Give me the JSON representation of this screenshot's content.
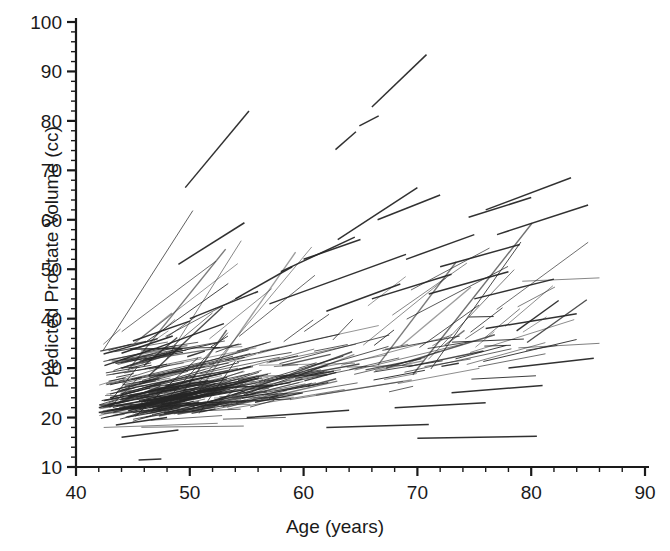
{
  "figure": {
    "background": "#ffffff",
    "ink_color": "#262626",
    "axis_color": "#1a1a1a"
  },
  "axes": {
    "x_title": "Age (years)",
    "y_title": "Predicted Prostate Volume (cc)",
    "x_ticks": [
      "40",
      "50",
      "60",
      "70",
      "80",
      "90"
    ],
    "y_ticks": [
      "10",
      "20",
      "30",
      "40",
      "50",
      "60",
      "70",
      "80",
      "90",
      "100"
    ],
    "x_minor_step": 2,
    "y_minor_step": 2,
    "frame": "left-and-bottom-only"
  },
  "chart_data": {
    "type": "line",
    "title": "",
    "subtitle": "",
    "xlabel": "Age (years)",
    "ylabel": "Predicted Prostate Volume (cc)",
    "xlim": [
      40,
      90
    ],
    "ylim": [
      10,
      100
    ],
    "xticks": [
      40,
      50,
      60,
      70,
      80,
      90
    ],
    "yticks": [
      10,
      20,
      30,
      40,
      50,
      60,
      70,
      80,
      90,
      100
    ],
    "grid": false,
    "legend": "none",
    "series_note": "Each series entry is one subject line segment: x = [age_start, age_end], y = [volume_start, volume_end].",
    "series": [
      {
        "name": "s1",
        "x": [
          49.6,
          55.2
        ],
        "y": [
          66.5,
          82.0
        ]
      },
      {
        "name": "s2",
        "x": [
          66.0,
          70.8
        ],
        "y": [
          82.8,
          93.4
        ]
      },
      {
        "name": "s3",
        "x": [
          62.8,
          64.6
        ],
        "y": [
          74.2,
          77.8
        ]
      },
      {
        "name": "s4",
        "x": [
          64.9,
          66.6
        ],
        "y": [
          79.0,
          81.0
        ]
      },
      {
        "name": "s5",
        "x": [
          49.0,
          54.8
        ],
        "y": [
          51.0,
          59.4
        ]
      },
      {
        "name": "s6",
        "x": [
          63.0,
          70.0
        ],
        "y": [
          56.0,
          66.5
        ]
      },
      {
        "name": "s7",
        "x": [
          66.5,
          72.0
        ],
        "y": [
          60.0,
          65.0
        ]
      },
      {
        "name": "s8",
        "x": [
          76.0,
          83.5
        ],
        "y": [
          62.0,
          68.5
        ]
      },
      {
        "name": "s9",
        "x": [
          74.5,
          80.0
        ],
        "y": [
          60.5,
          64.5
        ]
      },
      {
        "name": "s10",
        "x": [
          77.0,
          85.0
        ],
        "y": [
          57.0,
          63.0
        ]
      },
      {
        "name": "s11",
        "x": [
          58.0,
          64.5
        ],
        "y": [
          49.5,
          56.5
        ]
      },
      {
        "name": "s12",
        "x": [
          60.0,
          65.0
        ],
        "y": [
          52.0,
          56.0
        ]
      },
      {
        "name": "s13",
        "x": [
          63.0,
          69.0
        ],
        "y": [
          48.0,
          53.0
        ]
      },
      {
        "name": "s14",
        "x": [
          69.0,
          75.0
        ],
        "y": [
          52.0,
          57.0
        ]
      },
      {
        "name": "s15",
        "x": [
          72.0,
          79.0
        ],
        "y": [
          50.5,
          55.0
        ]
      },
      {
        "name": "s16",
        "x": [
          54.0,
          59.0
        ],
        "y": [
          44.0,
          50.5
        ]
      },
      {
        "name": "s17",
        "x": [
          50.0,
          56.0
        ],
        "y": [
          40.0,
          45.5
        ]
      },
      {
        "name": "s18",
        "x": [
          57.0,
          63.0
        ],
        "y": [
          43.0,
          48.0
        ]
      },
      {
        "name": "s19",
        "x": [
          62.0,
          68.5
        ],
        "y": [
          41.5,
          47.0
        ]
      },
      {
        "name": "s20",
        "x": [
          66.0,
          73.0
        ],
        "y": [
          44.0,
          49.0
        ]
      },
      {
        "name": "s21",
        "x": [
          71.0,
          78.0
        ],
        "y": [
          45.0,
          49.5
        ]
      },
      {
        "name": "s22",
        "x": [
          75.0,
          82.0
        ],
        "y": [
          44.0,
          48.0
        ]
      },
      {
        "name": "s23",
        "x": [
          44.0,
          48.5
        ],
        "y": [
          33.0,
          36.5
        ]
      },
      {
        "name": "s24",
        "x": [
          42.5,
          47.0
        ],
        "y": [
          30.5,
          34.0
        ]
      },
      {
        "name": "s25",
        "x": [
          45.0,
          50.0
        ],
        "y": [
          35.5,
          39.5
        ]
      },
      {
        "name": "s26",
        "x": [
          47.0,
          53.0
        ],
        "y": [
          34.0,
          39.0
        ]
      },
      {
        "name": "s27",
        "x": [
          43.0,
          46.5
        ],
        "y": [
          24.0,
          26.0
        ]
      },
      {
        "name": "s28",
        "x": [
          42.0,
          46.0
        ],
        "y": [
          21.0,
          22.5
        ]
      },
      {
        "name": "s29",
        "x": [
          43.5,
          48.0
        ],
        "y": [
          18.5,
          20.0
        ]
      },
      {
        "name": "s30",
        "x": [
          44.0,
          49.0
        ],
        "y": [
          16.0,
          17.5
        ]
      },
      {
        "name": "s31",
        "x": [
          45.5,
          47.5
        ],
        "y": [
          11.4,
          11.6
        ]
      },
      {
        "name": "s32",
        "x": [
          70.0,
          80.5
        ],
        "y": [
          15.8,
          16.2
        ]
      },
      {
        "name": "s33",
        "x": [
          62.0,
          71.0
        ],
        "y": [
          18.0,
          18.6
        ]
      },
      {
        "name": "s34",
        "x": [
          55.0,
          64.0
        ],
        "y": [
          20.0,
          21.5
        ]
      },
      {
        "name": "s35",
        "x": [
          76.0,
          84.0
        ],
        "y": [
          38.0,
          41.0
        ]
      },
      {
        "name": "s36",
        "x": [
          78.0,
          85.5
        ],
        "y": [
          30.0,
          32.0
        ]
      },
      {
        "name": "s37",
        "x": [
          73.0,
          81.0
        ],
        "y": [
          25.0,
          26.5
        ]
      },
      {
        "name": "s38",
        "x": [
          68.0,
          76.0
        ],
        "y": [
          22.0,
          23.0
        ]
      }
    ],
    "cluster": {
      "dense_age_range": [
        42,
        50
      ],
      "dense_volume_range": [
        14,
        32
      ],
      "n_subjects_approx": 400,
      "fan_apex_age": 43.5,
      "fan_apex_volume": 21.5,
      "max_volume_observed": 93.4,
      "min_volume_observed": 11.4,
      "max_age_observed": 86,
      "min_age_observed": 41.5
    }
  }
}
